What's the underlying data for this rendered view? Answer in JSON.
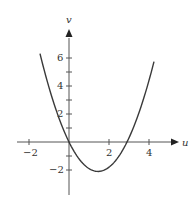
{
  "chart_data": {
    "type": "line",
    "title": "",
    "xlabel": "u",
    "ylabel": "v",
    "function": "v = u^2 - 2.9u (parabola through origin)",
    "xlim": [
      -2.6,
      5.4
    ],
    "ylim": [
      -3.8,
      8.4
    ],
    "x_ticks": [
      -2,
      2,
      4
    ],
    "x_minor_ticks": [
      -2,
      2,
      4
    ],
    "y_ticks": [
      6,
      4,
      2,
      -2
    ],
    "y_minor_ticks": [
      6,
      5,
      4,
      3,
      2,
      1,
      -1,
      -2
    ],
    "grid": false,
    "legend": null,
    "series": [
      {
        "name": "parabola",
        "color": "#3a3a3a",
        "x": [
          -1.45,
          -1.0,
          -0.5,
          0,
          0.5,
          1.0,
          1.45,
          2.0,
          2.5,
          2.9,
          3.5,
          4.0,
          4.25
        ],
        "y": [
          6.3,
          3.9,
          1.7,
          0,
          -1.2,
          -1.9,
          -2.1,
          -1.8,
          -1.0,
          0,
          2.1,
          4.4,
          5.7
        ]
      }
    ],
    "key_points": {
      "roots": [
        0,
        2.9
      ],
      "minimum": {
        "u": 1.45,
        "v": -2.1
      }
    }
  },
  "labels": {
    "x_axis": "u",
    "y_axis": "v",
    "x_tick_labels": [
      "−2",
      "2",
      "4"
    ],
    "y_tick_labels": [
      "6",
      "4",
      "2",
      "−2"
    ]
  },
  "colors": {
    "axis": "#555555",
    "curve": "#3a3a3a",
    "text": "#333333"
  }
}
